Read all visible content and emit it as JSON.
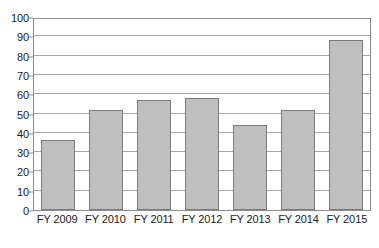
{
  "chart_data": {
    "type": "bar",
    "title": "",
    "subtitle": "",
    "xlabel": "",
    "ylabel": "",
    "categories": [
      "FY 2009",
      "FY 2010",
      "FY 2011",
      "FY 2012",
      "FY 2013",
      "FY 2014",
      "FY 2015"
    ],
    "values": [
      36.5,
      52,
      57,
      58,
      44,
      52,
      88
    ],
    "series": [
      {
        "name": "",
        "values": [
          36.5,
          52,
          57,
          58,
          44,
          52,
          88
        ]
      }
    ],
    "ylim": [
      0,
      100
    ],
    "ytick_labels": [
      "0",
      "10",
      "20",
      "30",
      "40",
      "50",
      "60",
      "70",
      "80",
      "90",
      "100"
    ],
    "ytick_values": [
      0,
      10,
      20,
      30,
      40,
      50,
      60,
      70,
      80,
      90,
      100
    ],
    "grid": true,
    "grid_axis": "y",
    "legend": false,
    "legend_position": "none",
    "colors": {
      "bar_fill": "#bfbfbf",
      "bar_border": "#7a7a7a",
      "gridline": "#a9a9a9",
      "axis": "#8c8c8c",
      "text": "#1a1a1a",
      "background": "#ffffff"
    }
  }
}
